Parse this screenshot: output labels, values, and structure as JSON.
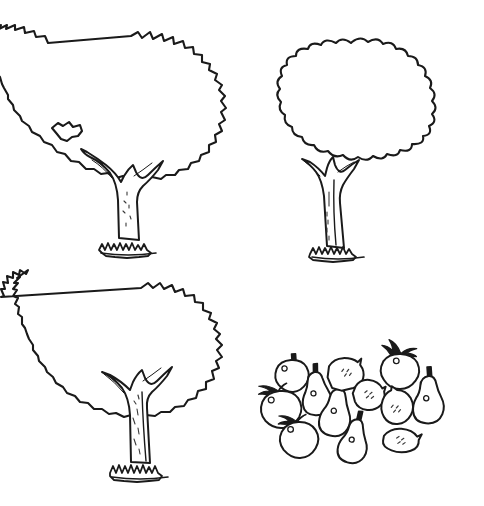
{
  "page": {
    "title": "Trees and Fruits Line Drawing",
    "description": "Black and white line-art coloring illustration",
    "width": 484,
    "height": 506,
    "background_color": "#ffffff",
    "ink_color": "#1a1a1a"
  },
  "trees": [
    {
      "id": "tree-top-left",
      "label": "Tree 1",
      "canopy_style": "jagged sawtooth",
      "canopy_center": {
        "x": 131,
        "y": 104
      },
      "canopy_radius_x": 100,
      "canopy_radius_y": 67,
      "trunk_base": {
        "x": 128,
        "y": 243
      },
      "has_grass_tuft": true,
      "has_leaf_notch": true
    },
    {
      "id": "tree-top-right",
      "label": "Tree 2",
      "canopy_style": "rounded scalloped lobes",
      "canopy_center": {
        "x": 352,
        "y": 105
      },
      "canopy_radius_x": 92,
      "canopy_radius_y": 62,
      "trunk_base": {
        "x": 340,
        "y": 250
      },
      "has_grass_tuft": true,
      "has_leaf_notch": false
    },
    {
      "id": "tree-bottom-left",
      "label": "Tree 3",
      "canopy_style": "crinkled bumpy",
      "canopy_center": {
        "x": 141,
        "y": 352
      },
      "canopy_radius_x": 100,
      "canopy_radius_y": 63,
      "trunk_base": {
        "x": 140,
        "y": 468
      },
      "has_grass_tuft": true,
      "has_leaf_notch": false
    }
  ],
  "fruit_cluster": {
    "label": "Fruit cluster",
    "counts": {
      "apple": 4,
      "pear": 5,
      "lemon": 4,
      "total": 13
    },
    "items": [
      {
        "type": "apple",
        "label": "Apple 1",
        "x": 292,
        "y": 375,
        "size": 21,
        "rotation": -4,
        "leaf": false,
        "dimple": true
      },
      {
        "type": "apple",
        "label": "Apple 2",
        "x": 281,
        "y": 407,
        "size": 25,
        "rotation": -6,
        "leaf": true,
        "dimple": true
      },
      {
        "type": "apple",
        "label": "Apple 3",
        "x": 299,
        "y": 437,
        "size": 24,
        "rotation": -3,
        "leaf": true,
        "dimple": true
      },
      {
        "type": "apple",
        "label": "Apple 4",
        "x": 400,
        "y": 369,
        "size": 23,
        "rotation": 2,
        "leaf": true,
        "dimple": true
      },
      {
        "type": "pear",
        "label": "Pear 1",
        "x": 316,
        "y": 390,
        "size": 24,
        "rotation": -8,
        "dimple": true
      },
      {
        "type": "pear",
        "label": "Pear 2",
        "x": 337,
        "y": 408,
        "size": 26,
        "rotation": 4,
        "dimple": true
      },
      {
        "type": "pear",
        "label": "Pear 3",
        "x": 355,
        "y": 437,
        "size": 24,
        "rotation": 6,
        "dimple": true
      },
      {
        "type": "pear",
        "label": "Pear 4",
        "x": 429,
        "y": 395,
        "size": 26,
        "rotation": -4,
        "dimple": true
      },
      {
        "type": "lemon",
        "label": "Lemon 1",
        "x": 345,
        "y": 372,
        "size": 23,
        "rotation": -8,
        "specks": true
      },
      {
        "type": "lemon",
        "label": "Lemon 2",
        "x": 369,
        "y": 392,
        "size": 21,
        "rotation": 6,
        "specks": true
      },
      {
        "type": "lemon",
        "label": "Lemon 3",
        "x": 396,
        "y": 403,
        "size": 24,
        "rotation": -4,
        "specks": true
      },
      {
        "type": "lemon",
        "label": "Lemon 4",
        "x": 402,
        "y": 437,
        "size": 22,
        "rotation": 10,
        "specks": true
      }
    ]
  }
}
